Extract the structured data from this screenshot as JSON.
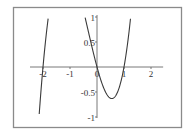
{
  "chart_data": {
    "type": "line",
    "title": "",
    "xlabel": "",
    "ylabel": "",
    "function": "x^3 + x^2 - 2x",
    "xlim": [
      -2.5,
      2.45
    ],
    "ylim": [
      -1,
      1
    ],
    "grid": false,
    "legend": null,
    "x_ticks": [
      -2,
      -1,
      0,
      1,
      2
    ],
    "x_tick_labels": [
      "-2",
      "-1",
      "0",
      "1",
      "2"
    ],
    "y_ticks": [
      1,
      0.5,
      -0.5,
      -1
    ],
    "y_tick_labels": [
      "1",
      "0.5",
      "-0.5",
      "-1"
    ],
    "series": [
      {
        "name": "f(x)",
        "x": [
          -2.21,
          -2.1,
          -2.0,
          -1.9,
          -1.8,
          -1.74,
          -0.45,
          -0.3,
          -0.2,
          -0.1,
          0.0,
          0.1,
          0.2,
          0.3,
          0.4,
          0.5,
          0.55,
          0.6,
          0.7,
          0.8,
          0.9,
          1.0,
          1.1,
          1.2,
          1.25
        ],
        "y": [
          -1.0,
          -0.5,
          0.0,
          0.44,
          0.84,
          1.0,
          1.0,
          0.663,
          0.432,
          0.209,
          0.0,
          -0.189,
          -0.352,
          -0.483,
          -0.576,
          -0.625,
          -0.63,
          -0.624,
          -0.567,
          -0.448,
          -0.261,
          0.0,
          0.341,
          0.768,
          1.0
        ]
      }
    ]
  }
}
